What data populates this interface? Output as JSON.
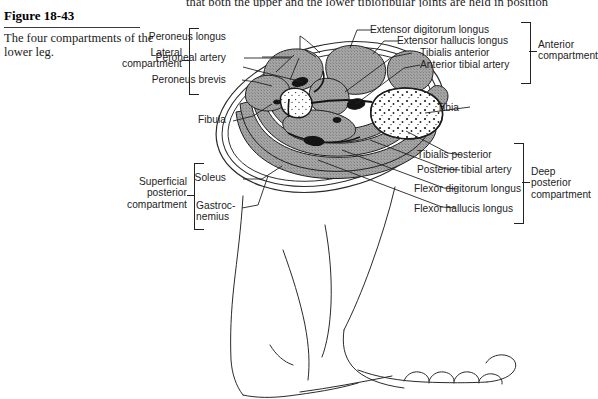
{
  "running_text": "that both the upper and the lower tibiofibular joints are held in position",
  "figure": {
    "number": "Figure 18-43",
    "caption": "The four compartments of the lower leg."
  },
  "compartments": [
    {
      "id": "lateral",
      "label": "Lateral\ncompartment",
      "side": "left"
    },
    {
      "id": "anterior",
      "label": "Anterior\ncompartment",
      "side": "right"
    },
    {
      "id": "superficial-posterior",
      "label": "Superficial\nposterior\ncompartment",
      "side": "left"
    },
    {
      "id": "deep-posterior",
      "label": "Deep\nposterior\ncompartment",
      "side": "right"
    }
  ],
  "labels": {
    "left": [
      {
        "id": "peroneus-longus",
        "text": "Peroneus longus"
      },
      {
        "id": "peroneal-artery",
        "text": "Peroneal artery"
      },
      {
        "id": "peroneus-brevis",
        "text": "Peroneus brevis"
      },
      {
        "id": "fibula",
        "text": "Fibula"
      },
      {
        "id": "soleus",
        "text": "Soleus"
      },
      {
        "id": "gastrocnemius",
        "text": "Gastroc-\nnemius"
      }
    ],
    "right": [
      {
        "id": "extensor-digitorum-longus",
        "text": "Extensor digitorum longus"
      },
      {
        "id": "extensor-hallucis-longus",
        "text": "Extensor hallucis longus"
      },
      {
        "id": "tibialis-anterior",
        "text": "Tibialis anterior"
      },
      {
        "id": "anterior-tibial-artery",
        "text": "Anterior tibial artery"
      },
      {
        "id": "tibia",
        "text": "Tibia"
      },
      {
        "id": "tibialis-posterior",
        "text": "Tibialis posterior"
      },
      {
        "id": "posterior-tibial-artery",
        "text": "Posterior tibial artery"
      },
      {
        "id": "flexor-digitorum-longus",
        "text": "Flexor digitorum longus"
      },
      {
        "id": "flexor-hallucis-longus",
        "text": "Flexor hallucis longus"
      }
    ]
  },
  "colors": {
    "ink": "#1c1c1c",
    "muscle_gray": "#9a9a9a",
    "bone_white": "#ffffff",
    "vessel_black": "#1a1a1a",
    "page": "#ffffff"
  },
  "artwork": {
    "cross_section_title": "lower-leg-cross-section",
    "foot_title": "lower-leg-and-foot-outline"
  }
}
